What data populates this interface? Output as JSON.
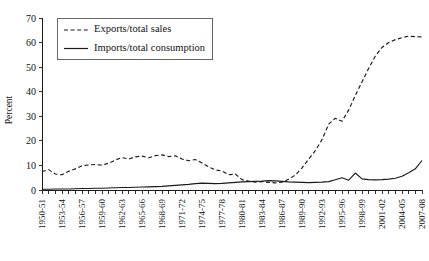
{
  "chart_data": {
    "type": "line",
    "title": "",
    "xlabel": "",
    "ylabel": "Percent",
    "ylim": [
      0,
      70
    ],
    "yticks": [
      0,
      10,
      20,
      30,
      40,
      50,
      60,
      70
    ],
    "grid": false,
    "legend_position": "top-left",
    "x": [
      "1950-51",
      "1951-52",
      "1952-53",
      "1953-54",
      "1954-55",
      "1955-56",
      "1956-57",
      "1957-58",
      "1958-59",
      "1959-60",
      "1960-61",
      "1961-62",
      "1962-63",
      "1963-64",
      "1964-65",
      "1965-66",
      "1966-67",
      "1967-68",
      "1968-69",
      "1969-70",
      "1970-71",
      "1971-72",
      "1972-73",
      "1973-74",
      "1974-75",
      "1975-76",
      "1976-77",
      "1977-78",
      "1978-79",
      "1979-80",
      "1980-81",
      "1981-82",
      "1982-83",
      "1983-84",
      "1984-85",
      "1985-86",
      "1986-87",
      "1987-88",
      "1988-89",
      "1989-90",
      "1990-91",
      "1991-92",
      "1992-93",
      "1993-94",
      "1994-95",
      "1995-96",
      "1996-97",
      "1997-98",
      "1998-99",
      "1999-00",
      "2000-01",
      "2001-02",
      "2002-03",
      "2003-04",
      "2004-05",
      "2005-06",
      "2006-07",
      "2007-08"
    ],
    "xtick_labels": [
      "1950-51",
      "1953-54",
      "1956-57",
      "1959-60",
      "1962-63",
      "1965-66",
      "1968-69",
      "1971-72",
      "1974-75",
      "1977-78",
      "1980-81",
      "1983-84",
      "1986-87",
      "1989-90",
      "1992-93",
      "1995-96",
      "1998-99",
      "2001-02",
      "2004-05",
      "2007-08"
    ],
    "xtick_indices": [
      0,
      3,
      6,
      9,
      12,
      15,
      18,
      21,
      24,
      27,
      30,
      33,
      36,
      39,
      42,
      45,
      48,
      51,
      54,
      57
    ],
    "series": [
      {
        "name": "Exports/total sales",
        "style": "dashed",
        "color": "#1a1a1a",
        "values": [
          7.5,
          8.3,
          6.5,
          6.2,
          7.6,
          8.6,
          9.9,
          10.2,
          10.4,
          10.1,
          10.9,
          12.2,
          13.2,
          12.6,
          13.5,
          13.8,
          13.1,
          14.0,
          14.3,
          13.6,
          13.9,
          12.6,
          11.9,
          12.4,
          11.0,
          9.4,
          8.2,
          7.7,
          6.2,
          6.5,
          4.2,
          3.6,
          3.2,
          3.4,
          3.1,
          2.9,
          3.2,
          4.4,
          6.1,
          9.0,
          12.6,
          16.0,
          20.5,
          26.8,
          29.2,
          28.0,
          32.5,
          38.5,
          44.0,
          49.5,
          54.5,
          58.0,
          60.0,
          61.2,
          62.0,
          62.6,
          62.4,
          62.3
        ]
      },
      {
        "name": "Imports/total consumption",
        "style": "solid",
        "color": "#1a1a1a",
        "values": [
          0.3,
          0.3,
          0.4,
          0.4,
          0.4,
          0.5,
          0.6,
          0.6,
          0.7,
          0.7,
          0.8,
          0.9,
          1.0,
          1.0,
          1.1,
          1.2,
          1.3,
          1.4,
          1.5,
          1.7,
          1.9,
          2.1,
          2.3,
          2.6,
          2.8,
          2.7,
          2.6,
          2.7,
          2.9,
          3.1,
          3.3,
          3.4,
          3.5,
          3.6,
          3.8,
          3.7,
          3.5,
          3.3,
          3.2,
          3.1,
          3.0,
          3.1,
          3.2,
          3.4,
          4.2,
          5.0,
          4.0,
          6.9,
          4.5,
          4.2,
          4.1,
          4.2,
          4.4,
          4.8,
          5.6,
          7.0,
          8.6,
          12.0
        ]
      }
    ],
    "legend": [
      {
        "label": "Exports/total sales",
        "style": "dashed"
      },
      {
        "label": "Imports/total consumption",
        "style": "solid"
      }
    ]
  }
}
